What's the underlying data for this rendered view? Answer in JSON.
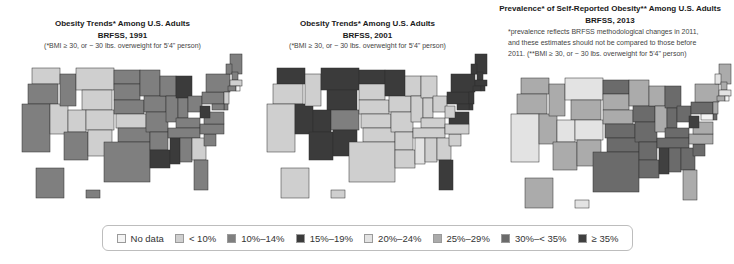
{
  "panels": [
    {
      "title": "Obesity Trends* Among U.S. Adults",
      "subtitle": "BRFSS, 1991",
      "note_lines": [
        "(*BMI ≥ 30, or ~ 30 lbs. overweight for 5'4\" person)"
      ]
    },
    {
      "title": "Obesity Trends* Among U.S. Adults",
      "subtitle": "BRFSS, 2001",
      "note_lines": [
        "(*BMI ≥ 30, or ~ 30 lbs. overweight for 5'4\" person)"
      ]
    },
    {
      "title": "Prevalence* of Self-Reported Obesity** Among U.S. Adults",
      "subtitle": "BRFSS, 2013",
      "note_lines": [
        "*prevalence reflects BRFSS methodological changes in 2011,",
        "and these estimates should not be compared to those before",
        "2011. (**BMI ≥ 30, or ~ 30 lbs. overweight for 5'4\" person)"
      ]
    }
  ],
  "legend": {
    "items": [
      {
        "label": "No data",
        "color": "#f4f4f4"
      },
      {
        "label": "< 10%",
        "color": "#cfcfcf"
      },
      {
        "label": "10%–14%",
        "color": "#7f7f7f"
      },
      {
        "label": "15%–19%",
        "color": "#3b3b3b"
      },
      {
        "label": "20%–24%",
        "color": "#e3e3e3"
      },
      {
        "label": "25%–29%",
        "color": "#ababab"
      },
      {
        "label": "30%–< 35%",
        "color": "#6b6b6b"
      },
      {
        "label": "≥ 35%",
        "color": "#404040"
      }
    ]
  },
  "chart_data": [
    {
      "type": "heatmap",
      "title": "Obesity Trends* Among U.S. Adults — BRFSS, 1991",
      "legend": [
        "No data",
        "< 10%",
        "10%–14%",
        "15%–19%"
      ],
      "categories_by_state_group": {
        "< 10%": [
          "WA",
          "MT",
          "WY",
          "NV",
          "UT",
          "CO",
          "NM",
          "KS",
          "GA",
          "MA",
          "NJ"
        ],
        "10%–14%": [
          "OR",
          "ID",
          "CA",
          "AZ",
          "ND",
          "SD",
          "NE",
          "MN",
          "IA",
          "MO",
          "OK",
          "TX",
          "AR",
          "WI",
          "IL",
          "IN",
          "OH",
          "KY",
          "TN",
          "AL",
          "FL",
          "SC",
          "NC",
          "VA",
          "PA",
          "NY",
          "ME",
          "VT",
          "NH",
          "CT",
          "MD",
          "DE",
          "AK",
          "HI"
        ],
        "15%–19%": [
          "MI",
          "WV",
          "LA",
          "MS"
        ]
      }
    },
    {
      "type": "heatmap",
      "title": "Obesity Trends* Among U.S. Adults — BRFSS, 2001",
      "legend": [
        "No data",
        "< 10%",
        "10%–14%",
        "15%–19%",
        "20%–24%"
      ],
      "categories_by_state_group": {
        "15%–19%": [
          "WA",
          "MT",
          "WY",
          "NV",
          "UT",
          "AZ",
          "NM",
          "ND",
          "MN",
          "FL",
          "VA",
          "MD",
          "NY",
          "PA",
          "ME",
          "VT",
          "NH",
          "MA",
          "CT",
          "RI",
          "NJ",
          "DE"
        ],
        "10%–14%": [
          "CO"
        ],
        "20%–24%": [
          "MS"
        ],
        "< 10%": [
          "OR",
          "ID",
          "CA",
          "SD",
          "NE",
          "KS",
          "OK",
          "TX",
          "IA",
          "MO",
          "AR",
          "LA",
          "WI",
          "IL",
          "MI",
          "IN",
          "OH",
          "KY",
          "TN",
          "AL",
          "GA",
          "SC",
          "NC",
          "WV",
          "AK",
          "HI"
        ]
      }
    },
    {
      "type": "heatmap",
      "title": "Prevalence* of Self-Reported Obesity** Among U.S. Adults — BRFSS, 2013",
      "legend": [
        "No data",
        "< 10%",
        "10%–14%",
        "15%–19%",
        "20%–24%",
        "25%–29%",
        "30%–< 35%",
        "≥ 35%"
      ],
      "categories_by_state_group": {
        "20%–24%": [
          "MT",
          "CA",
          "UT",
          "CO",
          "HI",
          "MA",
          "VT"
        ],
        "25%–29%": [
          "WA",
          "OR",
          "ID",
          "NV",
          "WY",
          "AZ",
          "NM",
          "SD",
          "NE",
          "MN",
          "WI",
          "IL",
          "FL",
          "VA",
          "NC",
          "NY",
          "ME",
          "NH",
          "CT",
          "NJ",
          "AK"
        ],
        "30%–< 35%": [
          "ND",
          "KS",
          "OK",
          "TX",
          "IA",
          "MO",
          "AR",
          "LA",
          "MI",
          "IN",
          "OH",
          "KY",
          "TN",
          "AL",
          "GA",
          "SC",
          "PA",
          "DE"
        ],
        "≥ 35%": [
          "MS",
          "WV"
        ]
      }
    }
  ]
}
